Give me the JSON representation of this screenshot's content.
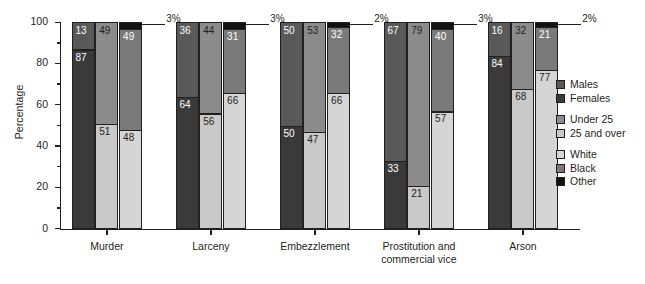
{
  "chart_data": {
    "type": "bar",
    "title": "",
    "xlabel": "",
    "ylabel": "Percentage",
    "ylim": [
      0,
      100
    ],
    "ytick_labels": [
      "0",
      "20",
      "40",
      "60",
      "80",
      "100"
    ],
    "ytick_values": [
      0,
      20,
      40,
      60,
      80,
      100
    ],
    "grid": false,
    "legend_position": "right",
    "stacked": true,
    "categories": [
      "Murder",
      "Larceny",
      "Embezzlement",
      "Prostitution and commercial vice",
      "Arson"
    ],
    "sub_bars": [
      "Sex",
      "Age",
      "Race"
    ],
    "series": [
      {
        "name": "Males",
        "group": "Sex",
        "color": "#595959",
        "values": [
          13,
          36,
          50,
          67,
          16
        ]
      },
      {
        "name": "Females",
        "group": "Sex",
        "color": "#3a3a3a",
        "values": [
          87,
          64,
          50,
          33,
          84
        ]
      },
      {
        "name": "Under 25",
        "group": "Age",
        "color": "#8c8c8c",
        "values": [
          49,
          44,
          53,
          79,
          32
        ]
      },
      {
        "name": "25 and over",
        "group": "Age",
        "color": "#c9c9c9",
        "values": [
          51,
          56,
          47,
          21,
          68
        ]
      },
      {
        "name": "White",
        "group": "Race",
        "color": "#d5d5d5",
        "values": [
          48,
          66,
          66,
          57,
          77
        ]
      },
      {
        "name": "Black",
        "group": "Race",
        "color": "#7a7a7a",
        "values": [
          49,
          31,
          32,
          40,
          21
        ]
      },
      {
        "name": "Other",
        "group": "Race",
        "color": "#111111",
        "values": [
          3,
          3,
          2,
          3,
          2
        ]
      }
    ],
    "annotations": [
      {
        "text": "3%",
        "category": "Murder"
      },
      {
        "text": "3%",
        "category": "Larceny"
      },
      {
        "text": "2%",
        "category": "Embezzlement"
      },
      {
        "text": "3%",
        "category": "Prostitution and commercial vice"
      },
      {
        "text": "2%",
        "category": "Arson"
      }
    ]
  },
  "legend": {
    "groups": [
      {
        "items": [
          {
            "label": "Males",
            "color": "#595959"
          },
          {
            "label": "Females",
            "color": "#3a3a3a"
          }
        ]
      },
      {
        "items": [
          {
            "label": "Under 25",
            "color": "#8c8c8c"
          },
          {
            "label": "25 and over",
            "color": "#c9c9c9"
          }
        ]
      },
      {
        "items": [
          {
            "label": "White",
            "color": "#d5d5d5"
          },
          {
            "label": "Black",
            "color": "#7a7a7a"
          },
          {
            "label": "Other",
            "color": "#111111"
          }
        ]
      }
    ]
  }
}
